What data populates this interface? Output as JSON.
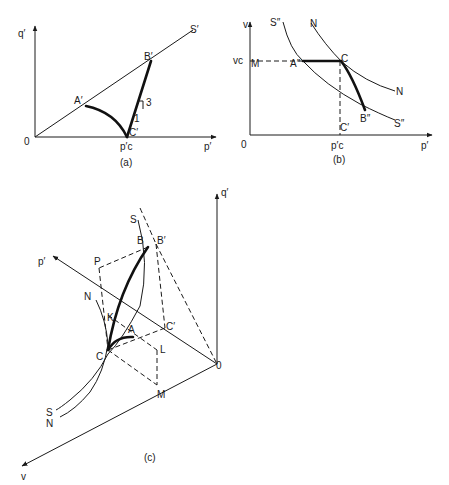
{
  "panels": {
    "a": {
      "caption": "(a)",
      "axes": {
        "x": "p′",
        "y": "q′",
        "origin": "0"
      },
      "line_label": "S′",
      "points": {
        "A": "A′",
        "B": "B′",
        "C": "C′"
      },
      "tick": "p′c",
      "slope": {
        "rise": "3",
        "run": "1"
      }
    },
    "b": {
      "caption": "(b)",
      "axes": {
        "x": "p′",
        "y": "v",
        "origin": "0"
      },
      "tick_x": "p′c",
      "tick_y": "vc",
      "points": {
        "A": "A″",
        "B": "B″",
        "C": "C",
        "Cp": "C′",
        "M": "M"
      },
      "curves": {
        "S_top": "S″",
        "S_end": "S″",
        "N_top": "N",
        "N_end": "N"
      }
    },
    "c": {
      "caption": "(c)",
      "axes": {
        "q": "q′",
        "p": "p′",
        "v": "v",
        "origin": "0"
      },
      "points": {
        "S": "S",
        "B": "B",
        "Bp": "B′",
        "P": "P",
        "N": "N",
        "K": "K",
        "A": "A",
        "Cp": "C′",
        "C": "C",
        "L": "L",
        "M": "M",
        "S_end": "S",
        "N_end": "N"
      }
    }
  }
}
